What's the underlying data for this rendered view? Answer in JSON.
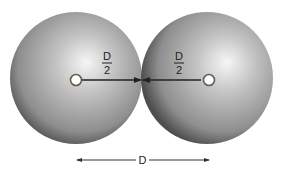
{
  "diagram": {
    "spheres": [
      {
        "id": "left",
        "cx": 76,
        "cy": 78,
        "r": 66
      },
      {
        "id": "right",
        "cx": 207,
        "cy": 78,
        "r": 66
      }
    ],
    "labels": {
      "left_radius_numerator": "D",
      "left_radius_denominator": "2",
      "right_radius_numerator": "D",
      "right_radius_denominator": "2",
      "distance": "D"
    },
    "colors": {
      "sphere_light": "#f4f4f4",
      "sphere_mid": "#b5b5b5",
      "sphere_dark": "#5a5a5a",
      "arrow": "#222222"
    }
  }
}
